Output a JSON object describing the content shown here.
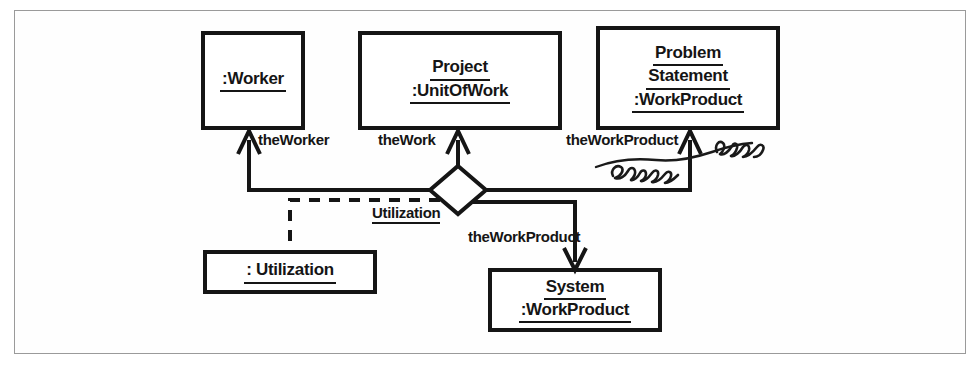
{
  "figure": {
    "kind": "uml-object-collaboration-diagram",
    "frame_border_color": "#9a9a9a",
    "ink_color": "#151515",
    "background": "#ffffff"
  },
  "nodes": [
    {
      "id": "worker",
      "name": "worker-object-box",
      "lines": [
        ":Worker"
      ],
      "x": 203,
      "y": 33,
      "width": 100,
      "height": 95
    },
    {
      "id": "project",
      "name": "project-unitofwork-object-box",
      "lines": [
        "Project",
        ":UnitOfWork"
      ],
      "x": 360,
      "y": 33,
      "width": 200,
      "height": 95
    },
    {
      "id": "problem_statement",
      "name": "problem-statement-workproduct-object-box",
      "lines": [
        "Problem",
        "Statement",
        ":WorkProduct"
      ],
      "x": 598,
      "y": 28,
      "width": 180,
      "height": 100
    },
    {
      "id": "utilization_object",
      "name": "utilization-object-box",
      "lines": [
        ": Utilization"
      ],
      "x": 205,
      "y": 252,
      "width": 170,
      "height": 40
    },
    {
      "id": "system",
      "name": "system-workproduct-object-box",
      "lines": [
        "System",
        ":WorkProduct"
      ],
      "x": 490,
      "y": 270,
      "width": 170,
      "height": 60
    }
  ],
  "diamond": {
    "name": "utilization-association-diamond",
    "cx": 458,
    "cy": 190,
    "rx": 28,
    "ry": 24
  },
  "edge_labels": [
    {
      "id": "theWorker",
      "name": "edge-label-theworker",
      "text": "theWorker",
      "x": 258,
      "y": 131,
      "underlined": false
    },
    {
      "id": "theWork",
      "name": "edge-label-thework",
      "text": "theWork",
      "x": 378,
      "y": 131,
      "underlined": false
    },
    {
      "id": "theWorkProductTop",
      "name": "edge-label-theworkproduct-top",
      "text": "theWorkProduct",
      "x": 566,
      "y": 131,
      "underlined": false
    },
    {
      "id": "utilization",
      "name": "edge-label-utilization",
      "text": "Utilization",
      "x": 372,
      "y": 204,
      "underlined": true
    },
    {
      "id": "theWorkProductBottom",
      "name": "edge-label-theworkproduct-bottom",
      "text": "theWorkProduct",
      "x": 468,
      "y": 228,
      "underlined": false
    }
  ],
  "annotation": {
    "name": "handwritten-margin-note",
    "text": "Relens user",
    "description": "handwritten cursive ink note over the theWorkProduct association"
  }
}
